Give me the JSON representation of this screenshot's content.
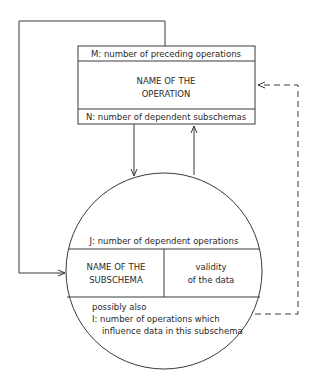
{
  "operation_box": {
    "top_label": "M: number of preceding operations",
    "name_line1": "NAME OF THE",
    "name_line2": "OPERATION",
    "bottom_label": "N: number of dependent subschemas"
  },
  "subschema_circle": {
    "top_label": "J: number of dependent operations",
    "name_line1": "NAME OF THE",
    "name_line2": "SUBSCHEMA",
    "validity_line1": "validity",
    "validity_line2": "of the data",
    "extra_line1": "possibly also",
    "extra_line2": "I: number of operations which",
    "extra_line3": "influence data in this subschema"
  },
  "colors": {
    "stroke": "#3a3a3a",
    "background": "#ffffff"
  }
}
